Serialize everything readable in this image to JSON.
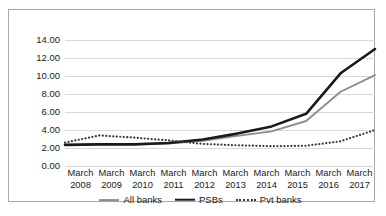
{
  "chart_data": {
    "type": "line",
    "title": "",
    "xlabel": "",
    "ylabel": "",
    "categories": [
      "March 2008",
      "March 2009",
      "March 2010",
      "March 2011",
      "March 2012",
      "March 2013",
      "March 2014",
      "March 2015",
      "March 2016",
      "March 2017"
    ],
    "category_lines": [
      {
        "top": "March",
        "bottom": "2008"
      },
      {
        "top": "March",
        "bottom": "2009"
      },
      {
        "top": "March",
        "bottom": "2010"
      },
      {
        "top": "March",
        "bottom": "2011"
      },
      {
        "top": "March",
        "bottom": "2012"
      },
      {
        "top": "March",
        "bottom": "2013"
      },
      {
        "top": "March",
        "bottom": "2014"
      },
      {
        "top": "March",
        "bottom": "2015"
      },
      {
        "top": "March",
        "bottom": "2016"
      },
      {
        "top": "March",
        "bottom": "2017"
      }
    ],
    "series": [
      {
        "name": "All banks",
        "style": "solid",
        "color": "#8c8c8c",
        "width": 1.9,
        "values": [
          2.35,
          2.4,
          2.4,
          2.5,
          2.8,
          3.35,
          3.85,
          5.0,
          8.25,
          10.1
        ]
      },
      {
        "name": "PSBs",
        "style": "solid",
        "color": "#1a1a1a",
        "width": 2.6,
        "values": [
          2.35,
          2.4,
          2.4,
          2.55,
          2.95,
          3.6,
          4.4,
          5.8,
          10.3,
          13.0
        ]
      },
      {
        "name": "Pvt banks",
        "style": "dotted",
        "color": "#3a3a3a",
        "width": 2.0,
        "values": [
          2.6,
          3.4,
          3.15,
          2.85,
          2.45,
          2.3,
          2.2,
          2.25,
          2.75,
          4.0
        ]
      }
    ],
    "ylim": [
      0,
      14
    ],
    "ystep": 2,
    "ytick_labels": [
      "0.00",
      "2.00",
      "4.00",
      "6.00",
      "8.00",
      "10.00",
      "12.00",
      "14.00"
    ],
    "grid": true,
    "legend_position": "bottom",
    "gridline_color": "#d9d9d9",
    "border_color": "#a8a8a8",
    "text_color": "#1a1a1a"
  },
  "legend": {
    "items": [
      {
        "label": "All banks"
      },
      {
        "label": "PSBs"
      },
      {
        "label": "Pvt banks"
      }
    ]
  }
}
